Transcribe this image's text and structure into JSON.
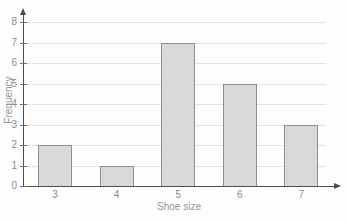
{
  "chart_data": {
    "type": "bar",
    "title": "",
    "categories": [
      "3",
      "4",
      "5",
      "6",
      "7"
    ],
    "values": [
      2,
      1,
      7,
      5,
      3
    ],
    "xlabel": "Shoe size",
    "ylabel": "Frequency",
    "ylim": [
      0,
      8
    ],
    "yticks": [
      0,
      1,
      2,
      3,
      4,
      5,
      6,
      7,
      8
    ],
    "grid": true,
    "legend": "none",
    "colors": {
      "bar_fill": "#d9d9d9",
      "bar_border": "#8f8f8f",
      "axis": "#4d4d4d",
      "gridline": "#e3e3e3",
      "tick_label": "#8c8c8c",
      "axis_title": "#949494",
      "background": "#fdfdfd"
    }
  }
}
